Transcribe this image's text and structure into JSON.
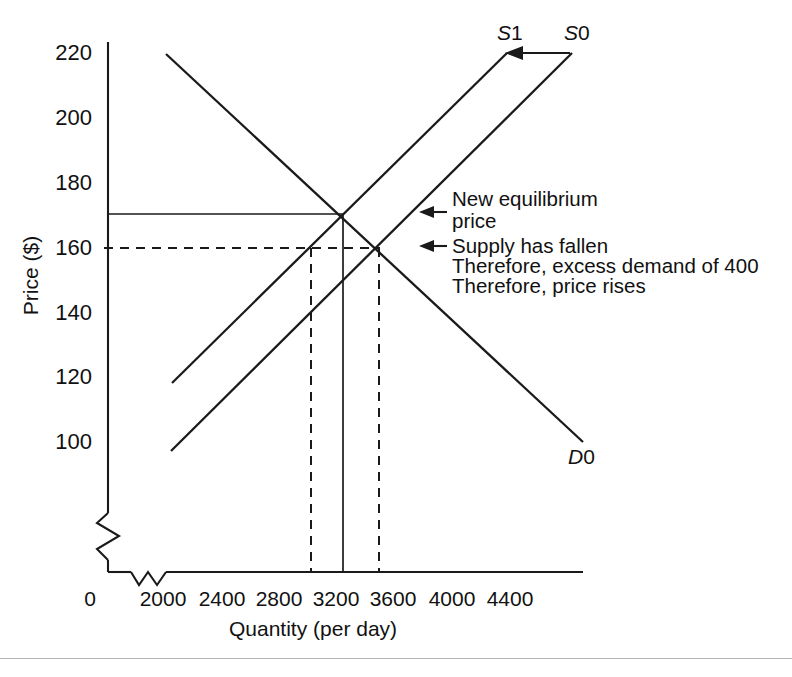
{
  "figure": {
    "axes": {
      "y_label": "Price ($)",
      "x_label": "Quantity (per day)",
      "y_ticks": [
        "220",
        "200",
        "180",
        "160",
        "140",
        "120",
        "100"
      ],
      "x_ticks": [
        "0",
        "2000",
        "2400",
        "2800",
        "3200",
        "3600",
        "4000",
        "4400"
      ],
      "y_axis_break": true,
      "x_axis_break": true
    },
    "curve_labels": {
      "supply_new": "S1",
      "supply_old": "S0",
      "demand": "D0"
    },
    "annotations": [
      "New equilibrium",
      "price",
      "Supply has fallen",
      "Therefore, excess demand of 400",
      "Therefore, price rises"
    ],
    "colors": {
      "line": "#1a1a1a",
      "rule": "#b4b4b4",
      "background": "#ffffff"
    }
  },
  "chart_data": {
    "type": "line",
    "title": "",
    "xlabel": "Quantity (per day)",
    "ylabel": "Price ($)",
    "xlim": [
      2000,
      4400
    ],
    "ylim": [
      100,
      220
    ],
    "grid": false,
    "legend": "inline-curve-labels",
    "series": [
      {
        "name": "S1",
        "role": "supply-after-shift",
        "style": "solid",
        "points": [
          [
            2000,
            118
          ],
          [
            3000,
            170
          ],
          [
            3600,
            201
          ],
          [
            3900,
            220
          ]
        ]
      },
      {
        "name": "S0",
        "role": "supply-before-shift",
        "style": "solid",
        "points": [
          [
            2000,
            97
          ],
          [
            3200,
            160
          ],
          [
            4300,
            220
          ]
        ]
      },
      {
        "name": "D0",
        "role": "demand",
        "style": "solid",
        "points": [
          [
            1970,
            220
          ],
          [
            3000,
            170
          ],
          [
            3200,
            160
          ],
          [
            4500,
            100
          ]
        ]
      }
    ],
    "markers": {
      "new_equilibrium": {
        "quantity": 3000,
        "price": 170
      },
      "old_equilibrium": {
        "quantity": 3200,
        "price": 160
      },
      "quantity_supplied_at_160": 2800,
      "excess_demand": 400
    },
    "reference_lines": [
      {
        "type": "horizontal",
        "value": 170,
        "style": "solid",
        "from_axis_to": 3000
      },
      {
        "type": "horizontal",
        "value": 160,
        "style": "dashed",
        "from_axis_to": 3200
      },
      {
        "type": "vertical",
        "value": 2800,
        "style": "dashed"
      },
      {
        "type": "vertical",
        "value": 3000,
        "style": "solid"
      },
      {
        "type": "vertical",
        "value": 3200,
        "style": "dashed"
      }
    ],
    "shift_arrow": {
      "from": "S0",
      "to": "S1",
      "direction": "left",
      "meaning": "supply has fallen"
    }
  }
}
